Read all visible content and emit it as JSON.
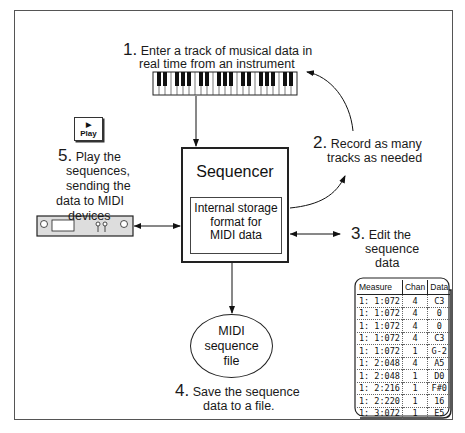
{
  "steps": {
    "step1": {
      "number": "1.",
      "line1": "Enter a track of musical data in",
      "line2": "real time from an instrument"
    },
    "step2": {
      "number": "2.",
      "line1": "Record as many",
      "line2": "tracks as needed"
    },
    "step3": {
      "number": "3.",
      "line1": "Edit the",
      "line2": "sequence",
      "line3": "data"
    },
    "step4": {
      "number": "4.",
      "line1": "Save the sequence",
      "line2": "data to a file."
    },
    "step5": {
      "number": "5.",
      "line1": "Play the",
      "line2": "sequences,",
      "line3": "sending the",
      "line4": "data to MIDI",
      "line5": "devices"
    }
  },
  "sequencer": {
    "title": "Sequencer",
    "storage_line1": "Internal storage",
    "storage_line2": "format for",
    "storage_line3": "MIDI data"
  },
  "midi_file": {
    "line1": "MIDI",
    "line2": "sequence",
    "line3": "file"
  },
  "play_button": {
    "icon": "play-triangle-icon",
    "label": "Play"
  },
  "event_table": {
    "columns": [
      "Measure",
      "Chan",
      "Data"
    ],
    "rows": [
      {
        "measure": "1:  1:072",
        "chan": "4",
        "data": "C3"
      },
      {
        "measure": "1:  1:072",
        "chan": "4",
        "data": "0"
      },
      {
        "measure": "1:  1:072",
        "chan": "4",
        "data": "0"
      },
      {
        "measure": "1:  1:072",
        "chan": "4",
        "data": "C3"
      },
      {
        "measure": "1:  1:072",
        "chan": "1",
        "data": "G-2"
      },
      {
        "measure": "1:  2:048",
        "chan": "4",
        "data": "A5"
      },
      {
        "measure": "1:  2:048",
        "chan": "1",
        "data": "D0"
      },
      {
        "measure": "1:  2:216",
        "chan": "1",
        "data": "F#0"
      },
      {
        "measure": "1:  2:220",
        "chan": "1",
        "data": "16"
      },
      {
        "measure": "1:  3:072",
        "chan": "1",
        "data": "E5"
      }
    ]
  }
}
